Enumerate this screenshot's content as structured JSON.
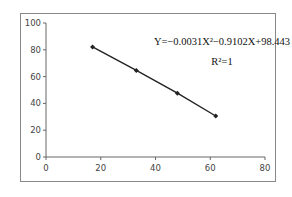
{
  "chart_data": {
    "type": "line",
    "title": "",
    "xlabel": "",
    "ylabel": "",
    "xlim": [
      0,
      80
    ],
    "ylim": [
      0,
      100
    ],
    "x_ticks": [
      0,
      20,
      40,
      60,
      80
    ],
    "y_ticks": [
      0,
      20,
      40,
      60,
      80,
      100
    ],
    "grid": false,
    "legend": null,
    "series": [
      {
        "name": "data",
        "x": [
          17,
          33,
          48,
          62
        ],
        "y": [
          82.1,
          64.6,
          47.6,
          30.6
        ],
        "color": "#222222",
        "marker": "diamond"
      }
    ],
    "annotations": [
      {
        "text": "Y=-0.0031X²-0.9102X+98.443",
        "x": 185,
        "y": 42
      },
      {
        "text": "R²=1",
        "x": 200,
        "y": 61
      }
    ]
  },
  "equation": {
    "line1": "Y=−0.0031X²−0.9102X+98.443",
    "line2": "R²=1"
  },
  "axes": {
    "x_labels": [
      "0",
      "20",
      "40",
      "60",
      "80"
    ],
    "y_labels": [
      "0",
      "20",
      "40",
      "60",
      "80",
      "100"
    ]
  }
}
